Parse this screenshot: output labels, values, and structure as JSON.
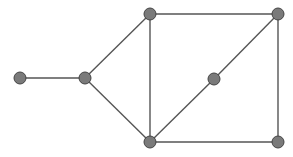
{
  "diagram": {
    "type": "graph",
    "style": {
      "node_fill": "#7a7a7a",
      "node_stroke": "#444444",
      "edge_color": "#555555",
      "node_radius": 6
    },
    "nodes": [
      {
        "id": "A",
        "x": 20,
        "y": 78
      },
      {
        "id": "B",
        "x": 85,
        "y": 78
      },
      {
        "id": "C",
        "x": 150,
        "y": 14
      },
      {
        "id": "D",
        "x": 278,
        "y": 14
      },
      {
        "id": "E",
        "x": 214,
        "y": 79
      },
      {
        "id": "F",
        "x": 150,
        "y": 142
      },
      {
        "id": "G",
        "x": 278,
        "y": 142
      }
    ],
    "edges": [
      [
        "A",
        "B"
      ],
      [
        "B",
        "C"
      ],
      [
        "B",
        "F"
      ],
      [
        "C",
        "D"
      ],
      [
        "C",
        "F"
      ],
      [
        "D",
        "E"
      ],
      [
        "E",
        "F"
      ],
      [
        "D",
        "G"
      ],
      [
        "F",
        "G"
      ]
    ]
  }
}
